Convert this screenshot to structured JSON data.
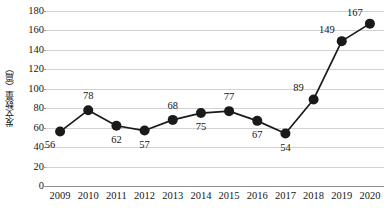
{
  "chart_data": {
    "type": "line",
    "title": "",
    "xlabel": "",
    "ylabel": "发文数量（篇）",
    "categories": [
      "2009",
      "2010",
      "2011",
      "2012",
      "2013",
      "2014",
      "2015",
      "2016",
      "2017",
      "2018",
      "2019",
      "2020"
    ],
    "values": [
      56,
      78,
      62,
      57,
      68,
      75,
      77,
      67,
      54,
      89,
      149,
      167
    ],
    "series": [
      {
        "name": "发文数量",
        "values": [
          56,
          78,
          62,
          57,
          68,
          75,
          77,
          67,
          54,
          89,
          149,
          167
        ]
      }
    ],
    "ylim": [
      0,
      180
    ],
    "y_ticks": [
      0,
      20,
      40,
      60,
      80,
      100,
      120,
      140,
      160,
      180
    ],
    "y_tick_labels": [
      "0",
      "20",
      "40",
      "60",
      "80",
      "100",
      "120",
      "140",
      "160",
      "180"
    ],
    "data_labels": [
      "56",
      "78",
      "62",
      "57",
      "68",
      "75",
      "77",
      "67",
      "54",
      "89",
      "149",
      "167"
    ],
    "data_label_positions": [
      "below-left",
      "above",
      "below",
      "below",
      "above",
      "below",
      "above",
      "below",
      "below",
      "above-left",
      "above-left",
      "above-left"
    ],
    "grid": true,
    "legend": "none",
    "line_color": "#1a1a1a",
    "marker_color": "#1a1a1a",
    "gridline_color": "#d2d2d2",
    "axis_color": "#8f8f8f",
    "text_color": "#161616",
    "background_color": "#ffffff",
    "marker": "circle",
    "marker_size": 5
  }
}
